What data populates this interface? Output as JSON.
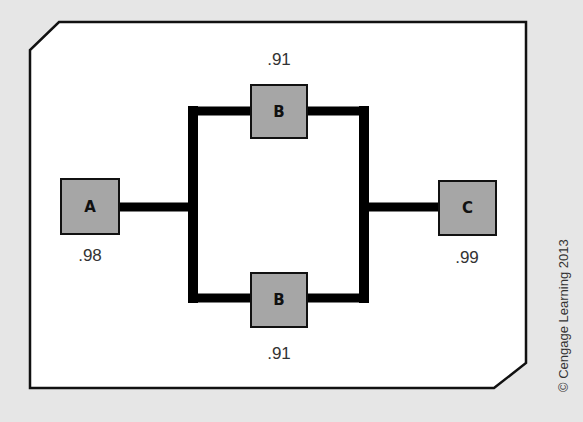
{
  "diagram": {
    "type": "reliability-block-diagram",
    "components": [
      {
        "id": "A",
        "label": "A",
        "reliability": ".98"
      },
      {
        "id": "B_top",
        "label": "B",
        "reliability": ".91"
      },
      {
        "id": "B_bottom",
        "label": "B",
        "reliability": ".91"
      },
      {
        "id": "C",
        "label": "C",
        "reliability": ".99"
      }
    ],
    "connections": [
      {
        "from": "A",
        "to": "B_top"
      },
      {
        "from": "A",
        "to": "B_bottom"
      },
      {
        "from": "B_top",
        "to": "C"
      },
      {
        "from": "B_bottom",
        "to": "C"
      }
    ],
    "credit": "© Cengage Learning 2013"
  },
  "colors": {
    "background": "#e6e6e6",
    "panel": "#ffffff",
    "box_fill": "#a6a6a6",
    "line": "#111111"
  }
}
